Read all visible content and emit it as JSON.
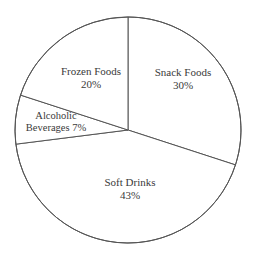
{
  "chart_data": {
    "type": "pie",
    "title": "",
    "subtitle": "",
    "xlabel": "",
    "ylabel": "",
    "legend": "none",
    "grid": false,
    "value_unit": "percent",
    "total": 100,
    "start_angle_deg": 0,
    "direction": "clockwise",
    "categories": [
      "Snack Foods",
      "Soft Drinks",
      "Alcoholic Beverages",
      "Frozen Foods"
    ],
    "values": [
      30,
      43,
      7,
      20
    ],
    "slices": [
      {
        "name": "Snack Foods",
        "value": 30,
        "value_label": "30%",
        "start_deg": 0,
        "end_deg": 108,
        "fill": "#ffffff",
        "stroke": "#555555"
      },
      {
        "name": "Soft Drinks",
        "value": 43,
        "value_label": "43%",
        "start_deg": 108,
        "end_deg": 262.8,
        "fill": "#ffffff",
        "stroke": "#555555"
      },
      {
        "name": "Alcoholic Beverages",
        "value": 7,
        "value_label": "7%",
        "start_deg": 262.8,
        "end_deg": 288,
        "fill": "#ffffff",
        "stroke": "#555555"
      },
      {
        "name": "Frozen Foods",
        "value": 20,
        "value_label": "20%",
        "start_deg": 288,
        "end_deg": 360,
        "fill": "#ffffff",
        "stroke": "#555555"
      }
    ]
  },
  "labels": {
    "snack_foods": {
      "name": "Snack Foods",
      "value": "30%"
    },
    "frozen_foods": {
      "name": "Frozen Foods",
      "value": "20%"
    },
    "alcoholic_beverages": {
      "name": "Alcoholic",
      "value": "Beverages 7%"
    },
    "soft_drinks": {
      "name": "Soft Drinks",
      "value": "43%"
    }
  },
  "geometry": {
    "center_x": 128,
    "center_y": 130,
    "radius": 113
  },
  "colors": {
    "background": "#ffffff",
    "stroke": "#555555",
    "text": "#3a3a3a"
  }
}
